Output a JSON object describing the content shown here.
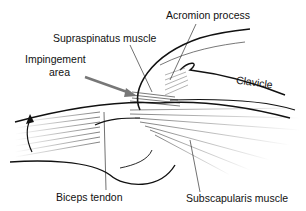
{
  "diagram": {
    "labels": {
      "acromion": "Acromion process",
      "supraspinatus": "Supraspinatus muscle",
      "impingement_line1": "Impingement",
      "impingement_line2": "area",
      "clavicle": "Clavicle",
      "biceps": "Biceps tendon",
      "subscapularis": "Subscapularis muscle"
    },
    "colors": {
      "line": "#111111",
      "arrow": "#777777",
      "muscle": "#444444"
    }
  }
}
